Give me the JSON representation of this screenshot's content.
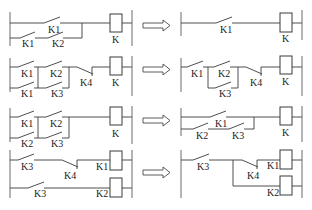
{
  "diagram": {
    "arrow_symbol": "double-outline right arrow",
    "rows": [
      {
        "before": {
          "contacts": [
            "K1",
            "K1",
            "K2"
          ],
          "coils": [
            "K"
          ]
        },
        "after": {
          "contacts": [
            "K1"
          ],
          "coils": [
            "K"
          ]
        }
      },
      {
        "before": {
          "contacts": [
            "K1",
            "K2",
            "K1",
            "K3",
            "K4"
          ],
          "coils": [
            "K"
          ]
        },
        "after": {
          "contacts": [
            "K1",
            "K2",
            "K3",
            "K4"
          ],
          "coils": [
            "K"
          ]
        }
      },
      {
        "before": {
          "contacts": [
            "K1",
            "K2",
            "K2",
            "K3"
          ],
          "coils": [
            "K"
          ]
        },
        "after": {
          "contacts": [
            "K1",
            "K2",
            "K3"
          ],
          "coils": [
            "K"
          ]
        }
      },
      {
        "before": {
          "contacts": [
            "K3",
            "K4",
            "K3"
          ],
          "coils": [
            "K1",
            "K2"
          ]
        },
        "after": {
          "contacts": [
            "K3",
            "K4"
          ],
          "coils": [
            "K1",
            "K2"
          ]
        }
      }
    ]
  },
  "labels": {
    "r1": {
      "b_k1_top": "K1",
      "b_k1_bot": "K1",
      "b_k2_bot": "K2",
      "b_coil": "K",
      "a_k1": "K1",
      "a_coil": "K"
    },
    "r2": {
      "b_k1_top": "K1",
      "b_k2_top": "K2",
      "b_k1_bot": "K1",
      "b_k3_bot": "K3",
      "b_k4": "K4",
      "b_coil": "K",
      "a_k1": "K1",
      "a_k2": "K2",
      "a_k3": "K3",
      "a_k4": "K4",
      "a_coil": "K"
    },
    "r3": {
      "b_k1_top": "K1",
      "b_k2_top": "K2",
      "b_k2_bot": "K2",
      "b_k3_bot": "K3",
      "b_coil": "K",
      "a_k1": "K1",
      "a_k2": "K2",
      "a_k3": "K3",
      "a_coil": "K"
    },
    "r4": {
      "b_k3_top": "K3",
      "b_k4": "K4",
      "b_coil1": "K1",
      "b_k3_bot": "K3",
      "b_coil2": "K2",
      "a_k3": "K3",
      "a_k4": "K4",
      "a_coil1": "K1",
      "a_coil2": "K2"
    }
  }
}
